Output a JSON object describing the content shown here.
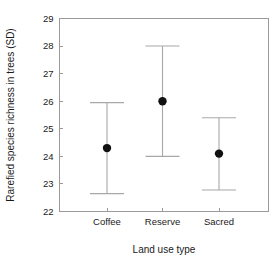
{
  "chart_data": {
    "type": "scatter",
    "title": "",
    "xlabel": "Land use type",
    "ylabel": "Rarefied species richness in trees (SD)",
    "categories": [
      "Coffee",
      "Reserve",
      "Sacred"
    ],
    "values": [
      24.3,
      26.0,
      24.1
    ],
    "error_upper": [
      25.95,
      28.0,
      25.4
    ],
    "error_lower": [
      22.65,
      24.0,
      22.78
    ],
    "series": [
      {
        "name": "Rarefied species richness",
        "points": [
          {
            "category": "Coffee",
            "mean": 24.3,
            "upper": 25.95,
            "lower": 22.65
          },
          {
            "category": "Reserve",
            "mean": 26.0,
            "upper": 28.0,
            "lower": 24.0
          },
          {
            "category": "Sacred",
            "mean": 24.1,
            "upper": 25.4,
            "lower": 22.78
          }
        ]
      }
    ],
    "ylim": [
      22,
      29
    ],
    "yticks": [
      22,
      23,
      24,
      25,
      26,
      27,
      28,
      29
    ],
    "ytick_labels": [
      "22",
      "23",
      "24",
      "25",
      "26",
      "27",
      "28",
      "29"
    ],
    "xtick_labels": [
      "Coffee",
      "Reserve",
      "Sacred"
    ],
    "grid": false,
    "legend": "none",
    "marker_color": "#111111",
    "errorbar_color": "#a8a8a8",
    "axis_color": "#9a9a9a",
    "background": "#ffffff"
  },
  "axes": {
    "y_axis_title": "Rarefied species richness in trees (SD)",
    "x_axis_title": "Land use type"
  }
}
